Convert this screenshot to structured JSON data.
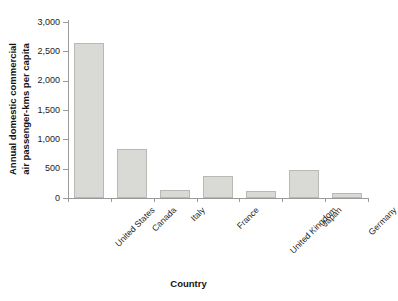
{
  "chart_data": {
    "type": "bar",
    "title": "",
    "xlabel": "Country",
    "ylabel": "Annual domestic commercial air passenger-kms per capita",
    "ylabel_line1": "Annual domestic commercial",
    "ylabel_line2": "air passenger-kms per capita",
    "categories": [
      "United States",
      "Canada",
      "Italy",
      "France",
      "United Kingdom",
      "Japan",
      "Germany"
    ],
    "values": [
      2650,
      830,
      135,
      375,
      120,
      480,
      85
    ],
    "ylim": [
      0,
      3000
    ],
    "yticks": [
      0,
      500,
      1000,
      1500,
      2000,
      2500,
      3000
    ],
    "ytick_labels": [
      "0",
      "500",
      "1,000",
      "1,500",
      "2,000",
      "2,500",
      "3,000"
    ],
    "grid": false,
    "legend": false,
    "bar_fill": "#d9d9d5",
    "bar_border": "#b9b9b4",
    "axis_color": "#9a9a9a",
    "background": "#ffffff"
  }
}
